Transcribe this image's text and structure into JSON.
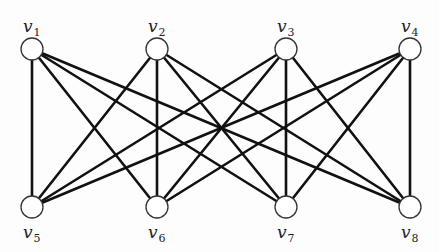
{
  "diagram": {
    "type": "bipartite-graph",
    "node_radius": 11,
    "edge_color": "#111111",
    "node_stroke": "#333333",
    "nodes": [
      {
        "id": "v1",
        "base": "v",
        "sub": "1",
        "x": 32,
        "y": 49,
        "label_pos": "top"
      },
      {
        "id": "v2",
        "base": "v",
        "sub": "2",
        "x": 157,
        "y": 49,
        "label_pos": "top"
      },
      {
        "id": "v3",
        "base": "v",
        "sub": "3",
        "x": 286,
        "y": 49,
        "label_pos": "top"
      },
      {
        "id": "v4",
        "base": "v",
        "sub": "4",
        "x": 410,
        "y": 49,
        "label_pos": "top"
      },
      {
        "id": "v5",
        "base": "v",
        "sub": "5",
        "x": 32,
        "y": 207,
        "label_pos": "bottom"
      },
      {
        "id": "v6",
        "base": "v",
        "sub": "6",
        "x": 157,
        "y": 207,
        "label_pos": "bottom"
      },
      {
        "id": "v7",
        "base": "v",
        "sub": "7",
        "x": 286,
        "y": 207,
        "label_pos": "bottom"
      },
      {
        "id": "v8",
        "base": "v",
        "sub": "8",
        "x": 410,
        "y": 207,
        "label_pos": "bottom"
      }
    ],
    "edges": [
      [
        "v1",
        "v5"
      ],
      [
        "v1",
        "v6"
      ],
      [
        "v1",
        "v7"
      ],
      [
        "v1",
        "v8"
      ],
      [
        "v2",
        "v5"
      ],
      [
        "v2",
        "v6"
      ],
      [
        "v2",
        "v7"
      ],
      [
        "v2",
        "v8"
      ],
      [
        "v3",
        "v5"
      ],
      [
        "v3",
        "v6"
      ],
      [
        "v3",
        "v7"
      ],
      [
        "v3",
        "v8"
      ],
      [
        "v4",
        "v5"
      ],
      [
        "v4",
        "v6"
      ],
      [
        "v4",
        "v7"
      ],
      [
        "v4",
        "v8"
      ]
    ]
  }
}
